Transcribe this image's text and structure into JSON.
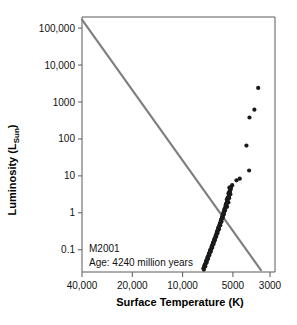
{
  "chart_data": {
    "type": "scatter",
    "title": "",
    "xlabel": "Surface Temperature (K)",
    "ylabel": "Luminosity (L",
    "ylabel_sub": "Sun",
    "ylabel_close": ")",
    "xlim": [
      40000,
      2800
    ],
    "ylim": [
      0.025,
      200000
    ],
    "xscale": "log-reversed",
    "yscale": "log",
    "grid": false,
    "legend": false,
    "xticks": [
      {
        "value": 40000,
        "label": "40,000"
      },
      {
        "value": 20000,
        "label": "20,000"
      },
      {
        "value": 10000,
        "label": "10,000"
      },
      {
        "value": 5000,
        "label": "5000"
      },
      {
        "value": 3000,
        "label": "3000"
      }
    ],
    "yticks": [
      {
        "value": 100000,
        "label": "100,000"
      },
      {
        "value": 10000,
        "label": "10,000"
      },
      {
        "value": 1000,
        "label": "1000"
      },
      {
        "value": 100,
        "label": "100"
      },
      {
        "value": 10,
        "label": "10"
      },
      {
        "value": 1,
        "label": "1"
      },
      {
        "value": 0.1,
        "label": "0.1"
      }
    ],
    "annotations": {
      "cluster_name": "M2001",
      "age_label": "Age: 4240 million years"
    },
    "series": [
      {
        "name": "Zero-age main sequence",
        "type": "line",
        "color": "#808080",
        "points": [
          {
            "x": 41500,
            "y": 170000
          },
          {
            "x": 3400,
            "y": 0.028
          }
        ]
      },
      {
        "name": "Cluster stars",
        "type": "scatter",
        "color": "#1a1a1a",
        "marker": "circle",
        "points": [
          {
            "x": 3530,
            "y": 2400
          },
          {
            "x": 3720,
            "y": 620
          },
          {
            "x": 3980,
            "y": 380
          },
          {
            "x": 4150,
            "y": 66
          },
          {
            "x": 4000,
            "y": 14
          },
          {
            "x": 4550,
            "y": 8.4
          },
          {
            "x": 4760,
            "y": 7.6
          },
          {
            "x": 5050,
            "y": 5.6
          },
          {
            "x": 5120,
            "y": 5.1
          },
          {
            "x": 5150,
            "y": 4.4
          },
          {
            "x": 5200,
            "y": 4.0
          },
          {
            "x": 5230,
            "y": 3.6
          },
          {
            "x": 5180,
            "y": 3.2
          },
          {
            "x": 5280,
            "y": 3.1
          },
          {
            "x": 5300,
            "y": 2.8
          },
          {
            "x": 5260,
            "y": 2.5
          },
          {
            "x": 5350,
            "y": 2.4
          },
          {
            "x": 5400,
            "y": 2.2
          },
          {
            "x": 5380,
            "y": 2.0
          },
          {
            "x": 5320,
            "y": 1.9
          },
          {
            "x": 5450,
            "y": 1.85
          },
          {
            "x": 5500,
            "y": 1.7
          },
          {
            "x": 5470,
            "y": 1.55
          },
          {
            "x": 5420,
            "y": 1.45
          },
          {
            "x": 5550,
            "y": 1.4
          },
          {
            "x": 5600,
            "y": 1.25
          },
          {
            "x": 5570,
            "y": 1.15
          },
          {
            "x": 5650,
            "y": 1.1
          },
          {
            "x": 5700,
            "y": 1.0
          },
          {
            "x": 5660,
            "y": 0.93
          },
          {
            "x": 5720,
            "y": 0.86
          },
          {
            "x": 5780,
            "y": 0.8
          },
          {
            "x": 5750,
            "y": 0.74
          },
          {
            "x": 5830,
            "y": 0.7
          },
          {
            "x": 5880,
            "y": 0.64
          },
          {
            "x": 5850,
            "y": 0.58
          },
          {
            "x": 5930,
            "y": 0.55
          },
          {
            "x": 5990,
            "y": 0.5
          },
          {
            "x": 5950,
            "y": 0.46
          },
          {
            "x": 6040,
            "y": 0.43
          },
          {
            "x": 6100,
            "y": 0.4
          },
          {
            "x": 6060,
            "y": 0.36
          },
          {
            "x": 6150,
            "y": 0.34
          },
          {
            "x": 6210,
            "y": 0.31
          },
          {
            "x": 6180,
            "y": 0.285
          },
          {
            "x": 6260,
            "y": 0.265
          },
          {
            "x": 6320,
            "y": 0.245
          },
          {
            "x": 6290,
            "y": 0.225
          },
          {
            "x": 6380,
            "y": 0.21
          },
          {
            "x": 6440,
            "y": 0.195
          },
          {
            "x": 6410,
            "y": 0.18
          },
          {
            "x": 6500,
            "y": 0.168
          },
          {
            "x": 6560,
            "y": 0.155
          },
          {
            "x": 6530,
            "y": 0.143
          },
          {
            "x": 6620,
            "y": 0.133
          },
          {
            "x": 6690,
            "y": 0.123
          },
          {
            "x": 6650,
            "y": 0.114
          },
          {
            "x": 6750,
            "y": 0.106
          },
          {
            "x": 6820,
            "y": 0.098
          },
          {
            "x": 6780,
            "y": 0.09
          },
          {
            "x": 6880,
            "y": 0.084
          },
          {
            "x": 6950,
            "y": 0.078
          },
          {
            "x": 6910,
            "y": 0.072
          },
          {
            "x": 7010,
            "y": 0.067
          },
          {
            "x": 7080,
            "y": 0.062
          },
          {
            "x": 7040,
            "y": 0.057
          },
          {
            "x": 7150,
            "y": 0.053
          },
          {
            "x": 7220,
            "y": 0.049
          },
          {
            "x": 7180,
            "y": 0.045
          },
          {
            "x": 7290,
            "y": 0.042
          },
          {
            "x": 7360,
            "y": 0.039
          },
          {
            "x": 7320,
            "y": 0.036
          },
          {
            "x": 7430,
            "y": 0.034
          },
          {
            "x": 7500,
            "y": 0.031
          },
          {
            "x": 7460,
            "y": 0.029
          },
          {
            "x": 5250,
            "y": 4.8
          },
          {
            "x": 5310,
            "y": 3.4
          },
          {
            "x": 5440,
            "y": 2.3
          },
          {
            "x": 5520,
            "y": 1.6
          },
          {
            "x": 5620,
            "y": 1.2
          },
          {
            "x": 5690,
            "y": 0.95
          },
          {
            "x": 5800,
            "y": 0.77
          },
          {
            "x": 5900,
            "y": 0.61
          },
          {
            "x": 6000,
            "y": 0.48
          },
          {
            "x": 6120,
            "y": 0.38
          },
          {
            "x": 6230,
            "y": 0.3
          },
          {
            "x": 6340,
            "y": 0.235
          },
          {
            "x": 6460,
            "y": 0.188
          },
          {
            "x": 6580,
            "y": 0.149
          },
          {
            "x": 6700,
            "y": 0.118
          },
          {
            "x": 6840,
            "y": 0.094
          },
          {
            "x": 6970,
            "y": 0.075
          },
          {
            "x": 7100,
            "y": 0.06
          },
          {
            "x": 7250,
            "y": 0.047
          },
          {
            "x": 7400,
            "y": 0.037
          },
          {
            "x": 5160,
            "y": 4.6
          },
          {
            "x": 5240,
            "y": 3.8
          },
          {
            "x": 5370,
            "y": 2.6
          },
          {
            "x": 5490,
            "y": 1.75
          },
          {
            "x": 5590,
            "y": 1.3
          },
          {
            "x": 5740,
            "y": 0.88
          },
          {
            "x": 5860,
            "y": 0.67
          },
          {
            "x": 5960,
            "y": 0.52
          },
          {
            "x": 6080,
            "y": 0.41
          },
          {
            "x": 6190,
            "y": 0.325
          },
          {
            "x": 6300,
            "y": 0.255
          },
          {
            "x": 6420,
            "y": 0.2
          },
          {
            "x": 6540,
            "y": 0.16
          },
          {
            "x": 6670,
            "y": 0.127
          },
          {
            "x": 6800,
            "y": 0.101
          },
          {
            "x": 6930,
            "y": 0.08
          },
          {
            "x": 7060,
            "y": 0.064
          },
          {
            "x": 7200,
            "y": 0.051
          },
          {
            "x": 7340,
            "y": 0.04
          },
          {
            "x": 7480,
            "y": 0.032
          }
        ]
      }
    ]
  }
}
